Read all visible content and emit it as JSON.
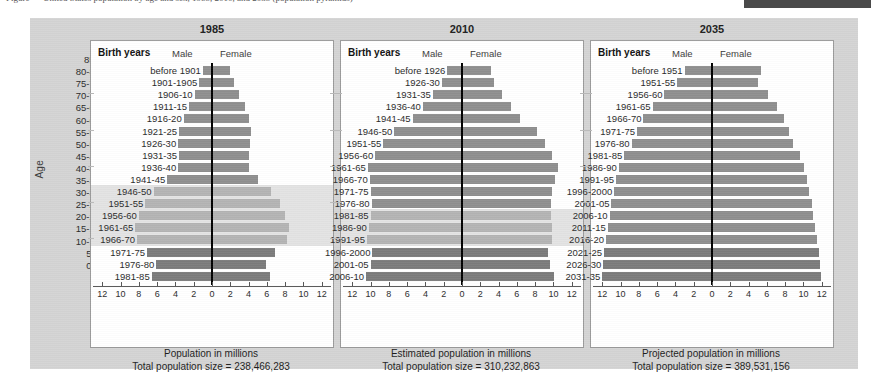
{
  "top_caption": "Figure — United States population by age and sex, 1985, 2010, and 2035 (population pyramids)",
  "figure": {
    "y_axis_label": "Age",
    "age_groups": [
      "85+",
      "80-84",
      "75-79",
      "70-74",
      "65-69",
      "60-64",
      "55-59",
      "50-54",
      "45-49",
      "40-44",
      "35-39",
      "30-34",
      "25-29",
      "20-24",
      "15-19",
      "10-14",
      "5-9",
      "0-4"
    ],
    "male_label": "Male",
    "female_label": "Female",
    "birth_years_header": "Birth years",
    "tick_labels": [
      "12",
      "10",
      "8",
      "6",
      "4",
      "2",
      "0",
      "2",
      "4",
      "6",
      "8",
      "10",
      "12"
    ],
    "colors": {
      "bar_standard": "#8f8f8f",
      "bar_dark": "#7c7c7c",
      "bar_light": "#b4b4b4",
      "highlight_band": "#e3e3e3",
      "panel_background": "#ffffff",
      "figure_background": "#d4d4d4",
      "centerline": "#000000"
    }
  },
  "chart_data": {
    "type": "bar",
    "xlabel": "Population in millions",
    "ylabel": "Age",
    "xlim": [
      -12,
      12
    ],
    "grid": true,
    "legend_position": "top-inside",
    "categories": [
      "85+",
      "80-84",
      "75-79",
      "70-74",
      "65-69",
      "60-64",
      "55-59",
      "50-54",
      "45-49",
      "40-44",
      "35-39",
      "30-34",
      "25-29",
      "20-24",
      "15-19",
      "10-14",
      "5-9",
      "0-4"
    ],
    "panels": [
      {
        "title": "1985",
        "axis_title": "Population in millions",
        "total_label": "Total population size = 238,466,283",
        "total_population": 238466283,
        "birth_years": [
          "before 1901",
          "1901-1905",
          "1906-10",
          "1911-15",
          "1916-20",
          "1921-25",
          "1926-30",
          "1931-35",
          "1936-40",
          "1941-45",
          "1946-50",
          "1951-55",
          "1956-60",
          "1961-65",
          "1966-70",
          "1971-75",
          "1976-80",
          "1981-85"
        ],
        "highlight_rows": [
          10,
          11,
          12,
          13,
          14
        ],
        "series": [
          {
            "name": "Male",
            "values": [
              1.0,
              1.4,
              1.9,
              2.5,
              3.1,
              3.6,
              3.7,
              3.6,
              3.7,
              4.9,
              6.4,
              7.3,
              8.0,
              8.4,
              8.2,
              7.1,
              6.1,
              6.6
            ]
          },
          {
            "name": "Female",
            "values": [
              2.0,
              2.4,
              3.0,
              3.6,
              4.1,
              4.3,
              4.2,
              4.0,
              4.0,
              5.0,
              6.5,
              7.4,
              8.0,
              8.4,
              8.2,
              6.9,
              5.9,
              6.3
            ]
          }
        ]
      },
      {
        "title": "2010",
        "axis_title": "Estimated population in millions",
        "total_label": "Total population size = 310,232,863",
        "total_population": 310232863,
        "birth_years": [
          "before 1926",
          "1926-30",
          "1931-35",
          "1936-40",
          "1941-45",
          "1946-50",
          "1951-55",
          "1956-60",
          "1961-65",
          "1966-70",
          "1971-75",
          "1976-80",
          "1981-85",
          "1986-90",
          "1991-95",
          "1996-2000",
          "2001-05",
          "2006-10"
        ],
        "highlight_rows": [
          12,
          13,
          14
        ],
        "series": [
          {
            "name": "Male",
            "values": [
              1.6,
              2.2,
              3.2,
              4.3,
              5.4,
              7.4,
              8.6,
              9.5,
              10.3,
              10.1,
              10.0,
              9.9,
              10.0,
              10.2,
              10.4,
              9.8,
              10.0,
              10.5
            ]
          },
          {
            "name": "Female",
            "values": [
              3.2,
              3.5,
              4.4,
              5.4,
              6.3,
              8.2,
              9.1,
              9.9,
              10.5,
              10.2,
              9.9,
              9.7,
              9.7,
              9.8,
              9.9,
              9.4,
              9.6,
              10.1
            ]
          }
        ]
      },
      {
        "title": "2035",
        "axis_title": "Projected population in millions",
        "total_label": "Total population size = 389,531,156",
        "total_population": 389531156,
        "birth_years": [
          "before 1951",
          "1951-55",
          "1956-60",
          "1961-65",
          "1966-70",
          "1971-75",
          "1976-80",
          "1981-85",
          "1986-90",
          "1991-95",
          "1996-2000",
          "2001-05",
          "2006-10",
          "2011-15",
          "2016-20",
          "2021-25",
          "2026-30",
          "2031-35"
        ],
        "highlight_rows": [],
        "series": [
          {
            "name": "Male",
            "values": [
              3.0,
              3.8,
              5.2,
              6.5,
              7.5,
              8.2,
              8.8,
              9.6,
              10.2,
              10.5,
              10.7,
              11.0,
              11.2,
              11.4,
              11.6,
              11.8,
              11.9,
              12.0
            ]
          },
          {
            "name": "Female",
            "values": [
              5.4,
              5.0,
              6.1,
              7.1,
              7.9,
              8.4,
              8.9,
              9.6,
              10.1,
              10.4,
              10.6,
              10.9,
              11.1,
              11.3,
              11.5,
              11.7,
              11.8,
              11.9
            ]
          }
        ]
      }
    ]
  }
}
